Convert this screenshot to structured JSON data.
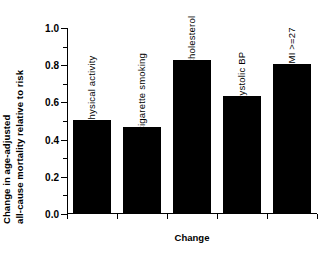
{
  "chart_data": {
    "type": "bar",
    "title": "",
    "categories": [
      "Physical activity",
      "Cigarette smoking",
      "Cholesterol",
      "Systolic BP",
      "BMI >=27"
    ],
    "values": [
      0.5,
      0.46,
      0.82,
      0.63,
      0.8
    ],
    "xlabel": "Change",
    "ylabel_line1": "Change in age-adjusted",
    "ylabel_line2": "all-cause mortality relative to risk",
    "ylim": [
      0.0,
      1.0
    ],
    "ytick_labels": [
      "1.0",
      "0.8",
      "0.6",
      "0.4",
      "0.2",
      "0.0"
    ],
    "ytick_values": [
      1.0,
      0.8,
      0.6,
      0.4,
      0.2,
      0.0
    ],
    "yminor_values": [
      0.9,
      0.7,
      0.5,
      0.3,
      0.1
    ],
    "grid": false,
    "legend": "none",
    "bar_color": "#000000",
    "background_color": "#ffffff"
  }
}
